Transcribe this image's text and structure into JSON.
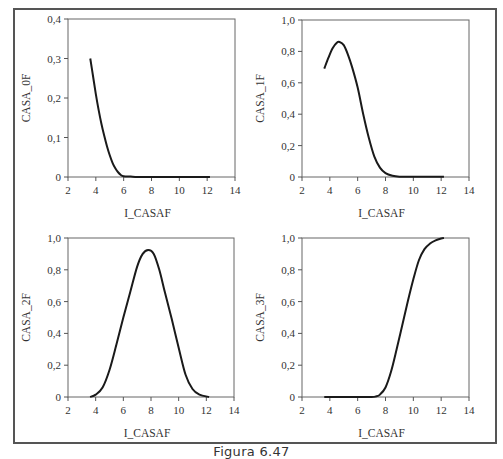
{
  "caption": "Figura 6.47",
  "chart_data": [
    {
      "type": "line",
      "title": "",
      "xlabel": "I_CASAF",
      "ylabel": "CASA_0F",
      "xlim": [
        2,
        14
      ],
      "ylim": [
        0,
        0.4
      ],
      "xticks": [
        2,
        4,
        6,
        8,
        10,
        12,
        14
      ],
      "xtick_labels": [
        "2",
        "4",
        "6",
        "8",
        "10",
        "12",
        "14"
      ],
      "yticks": [
        0,
        0.1,
        0.2,
        0.3,
        0.4
      ],
      "ytick_labels": [
        "0",
        "0,1",
        "0,2",
        "0,3",
        "0,4"
      ],
      "grid": false,
      "series": [
        {
          "name": "CASA_0F",
          "x": [
            3.6,
            3.8,
            4.0,
            4.2,
            4.4,
            4.6,
            4.8,
            5.0,
            5.2,
            5.4,
            5.6,
            5.8,
            6.0,
            6.5,
            7,
            8,
            9,
            10,
            11,
            12.2
          ],
          "y": [
            0.3,
            0.255,
            0.21,
            0.17,
            0.135,
            0.105,
            0.078,
            0.055,
            0.036,
            0.022,
            0.012,
            0.005,
            0.002,
            0.001,
            0.0,
            0.0,
            0.0,
            0.0,
            0.0,
            0.0
          ]
        }
      ]
    },
    {
      "type": "line",
      "title": "",
      "xlabel": "I_CASAF",
      "ylabel": "CASA_1F",
      "xlim": [
        2,
        14
      ],
      "ylim": [
        0,
        1.0
      ],
      "xticks": [
        2,
        4,
        6,
        8,
        10,
        12,
        14
      ],
      "xtick_labels": [
        "2",
        "4",
        "6",
        "8",
        "10",
        "12",
        "14"
      ],
      "yticks": [
        0,
        0.2,
        0.4,
        0.6,
        0.8,
        1.0
      ],
      "ytick_labels": [
        "0",
        "0,2",
        "0,4",
        "0,6",
        "0,8",
        "1,0"
      ],
      "grid": false,
      "series": [
        {
          "name": "CASA_1F",
          "x": [
            3.6,
            3.9,
            4.2,
            4.5,
            4.7,
            5.0,
            5.3,
            5.6,
            6.0,
            6.4,
            6.8,
            7.2,
            7.6,
            8.0,
            8.5,
            9.0,
            10,
            11,
            12.2
          ],
          "y": [
            0.69,
            0.76,
            0.82,
            0.855,
            0.86,
            0.84,
            0.78,
            0.7,
            0.57,
            0.4,
            0.25,
            0.13,
            0.06,
            0.025,
            0.008,
            0.002,
            0.001,
            0.001,
            0.001
          ]
        }
      ]
    },
    {
      "type": "line",
      "title": "",
      "xlabel": "I_CASAF",
      "ylabel": "CASA_2F",
      "xlim": [
        2,
        14
      ],
      "ylim": [
        0,
        1.0
      ],
      "xticks": [
        2,
        4,
        6,
        8,
        10,
        12,
        14
      ],
      "xtick_labels": [
        "2",
        "4",
        "6",
        "8",
        "10",
        "12",
        "14"
      ],
      "yticks": [
        0,
        0.2,
        0.4,
        0.6,
        0.8,
        1.0
      ],
      "ytick_labels": [
        "0",
        "0,2",
        "0,4",
        "0,6",
        "0,8",
        "1,0"
      ],
      "grid": false,
      "series": [
        {
          "name": "CASA_2F",
          "x": [
            3.6,
            4.0,
            4.5,
            5.0,
            5.5,
            6.0,
            6.5,
            7.0,
            7.4,
            7.8,
            8.2,
            8.6,
            9.0,
            9.5,
            10.0,
            10.5,
            11.0,
            11.5,
            12.2
          ],
          "y": [
            0.0,
            0.015,
            0.06,
            0.17,
            0.33,
            0.5,
            0.66,
            0.82,
            0.9,
            0.925,
            0.9,
            0.8,
            0.66,
            0.49,
            0.31,
            0.14,
            0.05,
            0.015,
            0.0
          ]
        }
      ]
    },
    {
      "type": "line",
      "title": "",
      "xlabel": "I_CASAF",
      "ylabel": "CASA_3F",
      "xlim": [
        2,
        14
      ],
      "ylim": [
        0,
        1.0
      ],
      "xticks": [
        2,
        4,
        6,
        8,
        10,
        12,
        14
      ],
      "xtick_labels": [
        "2",
        "4",
        "6",
        "8",
        "10",
        "12",
        "14"
      ],
      "yticks": [
        0,
        0.2,
        0.4,
        0.6,
        0.8,
        1.0
      ],
      "ytick_labels": [
        "0",
        "0,2",
        "0,4",
        "0,6",
        "0,8",
        "1,0"
      ],
      "grid": false,
      "series": [
        {
          "name": "CASA_3F",
          "x": [
            3.6,
            5,
            6,
            7,
            7.3,
            7.6,
            8.0,
            8.4,
            8.8,
            9.2,
            9.6,
            10.0,
            10.4,
            10.8,
            11.2,
            11.6,
            12.0,
            12.2
          ],
          "y": [
            0.0,
            0.0,
            0.0,
            0.0,
            0.003,
            0.015,
            0.06,
            0.16,
            0.3,
            0.45,
            0.6,
            0.74,
            0.86,
            0.93,
            0.965,
            0.985,
            0.997,
            1.0
          ]
        }
      ]
    }
  ]
}
